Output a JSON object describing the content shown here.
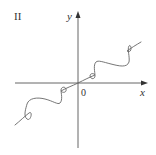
{
  "figure": {
    "panel_label": "II",
    "x_axis_label": "x",
    "y_axis_label": "y",
    "origin_label": "0",
    "colors": {
      "axes": "#555555",
      "curve": "#666666",
      "text": "#333333",
      "background": "#ffffff"
    }
  }
}
